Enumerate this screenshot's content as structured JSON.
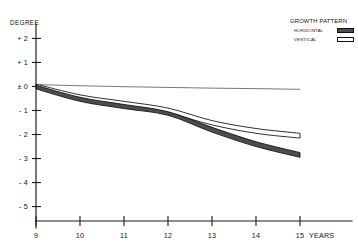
{
  "chart_data": {
    "type": "area",
    "title": "",
    "xlabel": "YEARS",
    "ylabel": "DEGREE",
    "xlim": [
      9,
      15
    ],
    "ylim": [
      -5.6,
      2.6
    ],
    "grid": false,
    "legend_position": "top-right",
    "x": [
      9,
      10,
      11,
      12,
      13,
      14,
      15
    ],
    "series": [
      {
        "name": "HORIZONTAL",
        "style": "filled-band",
        "color": "#4d4d4d",
        "upper": [
          0.05,
          -0.45,
          -0.75,
          -1.05,
          -1.7,
          -2.3,
          -2.75
        ],
        "lower": [
          -0.1,
          -0.62,
          -0.92,
          -1.2,
          -1.9,
          -2.5,
          -2.95
        ],
        "center": [
          -0.02,
          -0.53,
          -0.83,
          -1.12,
          -1.8,
          -2.4,
          -2.85
        ]
      },
      {
        "name": "VERTICAL",
        "style": "open-band",
        "color": "#ffffff",
        "upper": [
          0.1,
          -0.35,
          -0.62,
          -0.9,
          -1.42,
          -1.75,
          -1.95
        ],
        "lower": [
          -0.05,
          -0.52,
          -0.8,
          -1.1,
          -1.6,
          -1.95,
          -2.15
        ],
        "center": [
          0.02,
          -0.44,
          -0.71,
          -1.0,
          -1.51,
          -1.85,
          -2.05
        ]
      },
      {
        "name": "REFERENCE",
        "style": "thin-line",
        "color": "#4a4a4a",
        "values": [
          0.08,
          0.03,
          -0.01,
          -0.04,
          -0.07,
          -0.09,
          -0.12
        ]
      }
    ],
    "yticks": [
      "+ 2",
      "+ 1",
      "± 0",
      "- 1",
      "- 2",
      "- 3",
      "- 4",
      "- 5"
    ],
    "ytick_values": [
      2,
      1,
      0,
      -1,
      -2,
      -3,
      -4,
      -5
    ],
    "xticks": [
      "9",
      "10",
      "11",
      "12",
      "13",
      "14",
      "15"
    ],
    "xtick_values": [
      9,
      10,
      11,
      12,
      13,
      14,
      15
    ]
  },
  "legend": {
    "title": "GROWTH PATTERN",
    "items": [
      {
        "label": "HORIZONTAL",
        "swatch": "filled"
      },
      {
        "label": "VERTICAL",
        "swatch": "open"
      }
    ]
  },
  "axes": {
    "y_title": "DEGREE",
    "x_title": "YEARS"
  }
}
